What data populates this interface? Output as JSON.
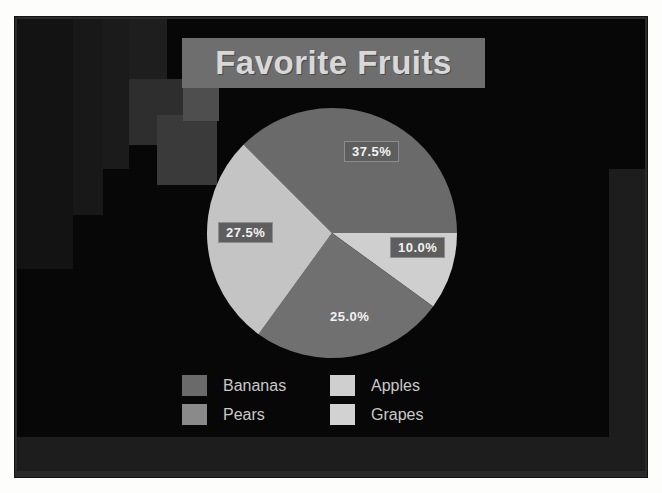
{
  "slide": {
    "title": "Favorite Fruits"
  },
  "chart_data": {
    "type": "pie",
    "title": "Favorite Fruits",
    "xlabel": "",
    "ylabel": "",
    "legend_position": "bottom",
    "grid": false,
    "units": "percent",
    "total": 100.0,
    "start_angle_deg": 0,
    "categories": [
      "Bananas",
      "Apples",
      "Grapes",
      "Pears"
    ],
    "values": [
      37.5,
      10.0,
      25.0,
      27.5
    ],
    "labels": [
      "37.5%",
      "10.0%",
      "25.0%",
      "27.5%"
    ],
    "colors": [
      "#6a6a6a",
      "#cfcfcf",
      "#707070",
      "#c4c4c4"
    ],
    "slices": [
      {
        "name": "Bananas",
        "value": 37.5,
        "label": "37.5%",
        "color": "#6a6a6a",
        "start_deg": 0,
        "end_deg": 135,
        "label_boxed": true
      },
      {
        "name": "Apples",
        "value": 10.0,
        "label": "10.0%",
        "color": "#cfcfcf",
        "start_deg": 324,
        "end_deg": 360,
        "label_boxed": true
      },
      {
        "name": "Grapes",
        "value": 25.0,
        "label": "25.0%",
        "color": "#707070",
        "start_deg": 234,
        "end_deg": 324,
        "label_boxed": false
      },
      {
        "name": "Pears",
        "value": 27.5,
        "label": "27.5%",
        "color": "#c4c4c4",
        "start_deg": 135,
        "end_deg": 234,
        "label_boxed": true
      }
    ]
  },
  "legend": {
    "items": [
      {
        "label": "Bananas",
        "color": "#6a6a6a"
      },
      {
        "label": "Apples",
        "color": "#cfcfcf"
      },
      {
        "label": "Pears",
        "color": "#8a8a8a"
      },
      {
        "label": "Grapes",
        "color": "#d2d2d2"
      }
    ]
  },
  "theme": {
    "canvas_background": "#070707",
    "frame_background": "#fdfdfb",
    "title_banner": "#6e6e6e",
    "title_text": "#d8d8d8",
    "label_text": "#f2f2f2",
    "label_box": "#5e5e5e",
    "legend_text": "#c9c9c9"
  }
}
